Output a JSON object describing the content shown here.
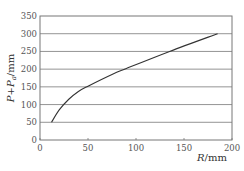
{
  "chart_data": {
    "type": "line",
    "title": "",
    "xlabel": "R/mm",
    "ylabel": "P+P_a/mm",
    "xlim": [
      0,
      200
    ],
    "ylim": [
      0,
      350
    ],
    "x_ticks": [
      "0",
      "50",
      "100",
      "150",
      "200"
    ],
    "y_ticks": [
      "0",
      "50",
      "100",
      "150",
      "200",
      "250",
      "300",
      "350"
    ],
    "grid": "horizontal",
    "legend": null,
    "series": [
      {
        "name": "P+Pa vs R",
        "x": [
          12,
          20,
          30,
          40,
          50,
          75,
          90,
          135,
          185
        ],
        "values": [
          50,
          85,
          115,
          137,
          152,
          185,
          202,
          250,
          300
        ]
      }
    ]
  },
  "labels": {
    "x_axis": "R/mm",
    "y_axis_main": "P+P",
    "y_axis_sub": "a",
    "y_axis_unit": "/mm"
  }
}
